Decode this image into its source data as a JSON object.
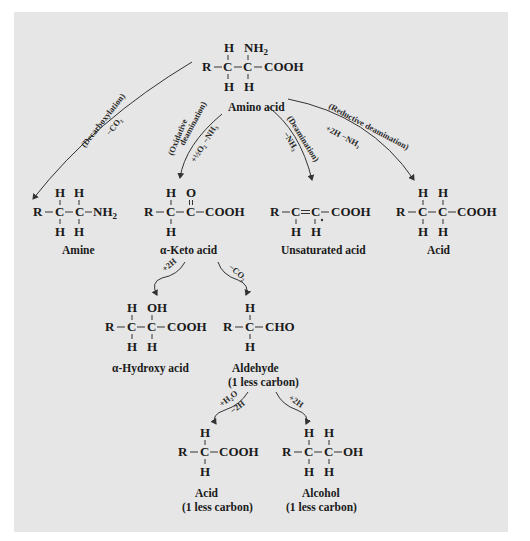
{
  "diagram": {
    "background_color": "#e6e6e6",
    "nodes": [
      {
        "id": "amino_acid",
        "label": "Amino acid",
        "structure": "R—C(H)(H)—C(NH2)(H)—COOH",
        "atoms": {
          "R": "R",
          "C1": "C",
          "C2": "C",
          "top1": "H",
          "top2": "NH",
          "top2_sub": "2",
          "bot1": "H",
          "bot2": "H",
          "right": "COOH"
        }
      },
      {
        "id": "amine",
        "label": "Amine",
        "structure": "R—C(H)(H)—C(H)(H)—NH2",
        "atoms": {
          "R": "R",
          "C1": "C",
          "C2": "C",
          "top1": "H",
          "top2": "H",
          "bot1": "H",
          "bot2": "H",
          "right": "NH",
          "right_sub": "2"
        }
      },
      {
        "id": "keto_acid",
        "label": "α-Keto acid",
        "structure": "R—C(H)(H)—C(=O)—COOH",
        "atoms": {
          "R": "R",
          "C1": "C",
          "C2": "C",
          "top1": "H",
          "top2": "O",
          "bot1": "H",
          "right": "COOH"
        }
      },
      {
        "id": "unsaturated_acid",
        "label": "Unsaturated acid",
        "structure": "R—C(H)=C(H)—COOH",
        "atoms": {
          "R": "R",
          "C1": "C",
          "C2": "C",
          "bot1": "H",
          "bot2": "H",
          "right": "COOH"
        }
      },
      {
        "id": "acid",
        "label": "Acid",
        "structure": "R—C(H)(H)—C(H)(H)—COOH",
        "atoms": {
          "R": "R",
          "C1": "C",
          "C2": "C",
          "top1": "H",
          "top2": "H",
          "bot1": "H",
          "bot2": "H",
          "right": "COOH"
        }
      },
      {
        "id": "hydroxy_acid",
        "label": "α-Hydroxy acid",
        "structure": "R—C(H)(H)—C(OH)(H)—COOH",
        "atoms": {
          "R": "R",
          "C1": "C",
          "C2": "C",
          "top1": "H",
          "top2": "OH",
          "bot1": "H",
          "bot2": "H",
          "right": "COOH"
        }
      },
      {
        "id": "aldehyde",
        "label": "Aldehyde",
        "label2": "(1 less carbon)",
        "structure": "R—C(H)(H)—CHO",
        "atoms": {
          "R": "R",
          "C1": "C",
          "top1": "H",
          "bot1": "H",
          "right": "CHO"
        }
      },
      {
        "id": "acid_less",
        "label": "Acid",
        "label2": "(1 less carbon)",
        "structure": "R—C(H)(H)—COOH",
        "atoms": {
          "R": "R",
          "C1": "C",
          "top1": "H",
          "bot1": "H",
          "right": "COOH"
        }
      },
      {
        "id": "alcohol",
        "label": "Alcohol",
        "label2": "(1 less carbon)",
        "structure": "R—C(H)(H)—C(H)(H)—OH",
        "atoms": {
          "R": "R",
          "C1": "C",
          "C2": "C",
          "top1": "H",
          "top2": "H",
          "bot1": "H",
          "bot2": "H",
          "right": "OH"
        }
      }
    ],
    "edges": [
      {
        "from": "amino_acid",
        "to": "amine",
        "name": "(Decarboxylation)",
        "reagent": "−CO₂"
      },
      {
        "from": "amino_acid",
        "to": "keto_acid",
        "name": "(Oxidative",
        "name2": "deamination)",
        "reagent": "+½O₂  −NH₃"
      },
      {
        "from": "amino_acid",
        "to": "unsaturated_acid",
        "name": "(Deamination)",
        "reagent": "−NH₃"
      },
      {
        "from": "amino_acid",
        "to": "acid",
        "name": "(Reductive deamination)",
        "reagent": "+2H   −NH₃"
      },
      {
        "from": "keto_acid",
        "to": "hydroxy_acid",
        "reagent": "+2H"
      },
      {
        "from": "keto_acid",
        "to": "aldehyde",
        "reagent": "−CO₂"
      },
      {
        "from": "aldehyde",
        "to": "acid_less",
        "reagent": "+H₂O",
        "reagent2": "−2H"
      },
      {
        "from": "aldehyde",
        "to": "alcohol",
        "reagent": "+2H"
      }
    ]
  }
}
